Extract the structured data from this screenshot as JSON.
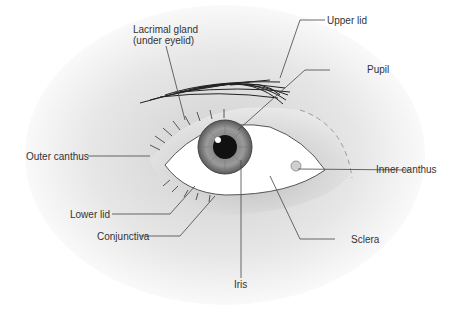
{
  "diagram": {
    "labels": {
      "lacrimal_gland_line1": "Lacrimal gland",
      "lacrimal_gland_line2": "(under eyelid)",
      "upper_lid": "Upper lid",
      "pupil": "Pupil",
      "outer_canthus": "Outer canthus",
      "inner_canthus": "Inner canthus",
      "lower_lid": "Lower lid",
      "conjunctiva": "Conjunctiva",
      "sclera": "Sclera",
      "iris": "Iris"
    },
    "colors": {
      "background_shade": "#d9d9d9",
      "iris": "#8a8a8a",
      "pupil": "#111111",
      "sclera": "#ffffff",
      "leader_line": "#444444",
      "text": "#333333"
    }
  }
}
